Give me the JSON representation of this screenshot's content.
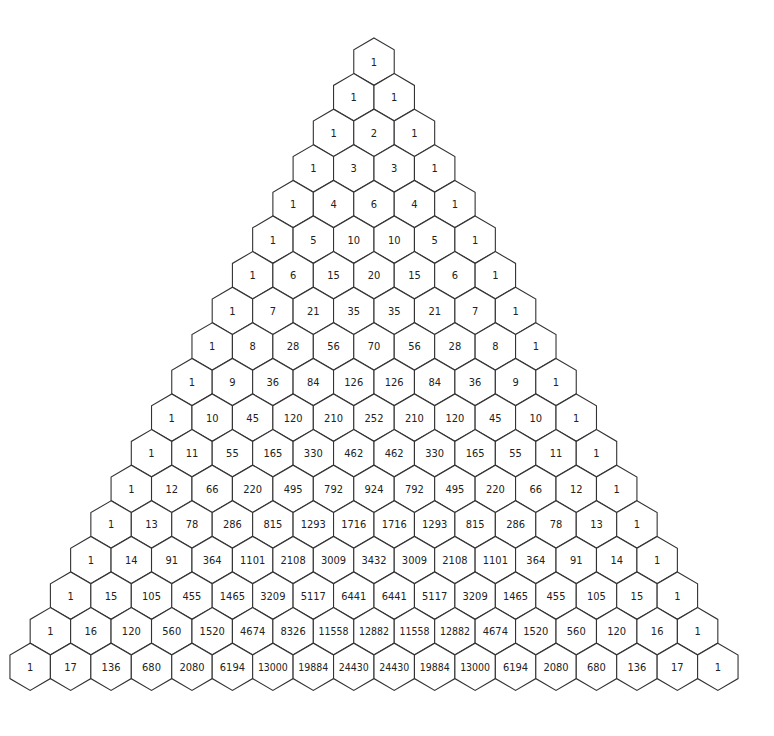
{
  "diagram": {
    "type": "hexagonal-number-triangle",
    "rows": [
      [
        1
      ],
      [
        1,
        1
      ],
      [
        1,
        2,
        1
      ],
      [
        1,
        3,
        3,
        1
      ],
      [
        1,
        4,
        6,
        4,
        1
      ],
      [
        1,
        5,
        10,
        10,
        5,
        1
      ],
      [
        1,
        6,
        15,
        20,
        15,
        6,
        1
      ],
      [
        1,
        7,
        21,
        35,
        35,
        21,
        7,
        1
      ],
      [
        1,
        8,
        28,
        56,
        70,
        56,
        28,
        8,
        1
      ],
      [
        1,
        9,
        36,
        84,
        126,
        126,
        84,
        36,
        9,
        1
      ],
      [
        1,
        10,
        45,
        120,
        210,
        252,
        210,
        120,
        45,
        10,
        1
      ],
      [
        1,
        11,
        55,
        165,
        330,
        462,
        462,
        330,
        165,
        55,
        11,
        1
      ],
      [
        1,
        12,
        66,
        220,
        495,
        792,
        924,
        792,
        495,
        220,
        66,
        12,
        1
      ],
      [
        1,
        13,
        78,
        286,
        815,
        1293,
        1716,
        1716,
        1293,
        815,
        286,
        78,
        13,
        1
      ],
      [
        1,
        14,
        91,
        364,
        1101,
        2108,
        3009,
        3432,
        3009,
        2108,
        1101,
        364,
        91,
        14,
        1
      ],
      [
        1,
        15,
        105,
        455,
        1465,
        3209,
        5117,
        6441,
        6441,
        5117,
        3209,
        1465,
        455,
        105,
        15,
        1
      ],
      [
        1,
        16,
        120,
        560,
        1520,
        4674,
        8326,
        11558,
        12882,
        11558,
        12882,
        4674,
        1520,
        560,
        120,
        16,
        1
      ],
      [
        1,
        17,
        136,
        680,
        2080,
        6194,
        13000,
        19884,
        24430,
        24430,
        19884,
        13000,
        6194,
        2080,
        680,
        136,
        17,
        1
      ]
    ],
    "colors": {
      "background": "#ffffff",
      "stroke": "#333333",
      "text": "#222222"
    }
  }
}
